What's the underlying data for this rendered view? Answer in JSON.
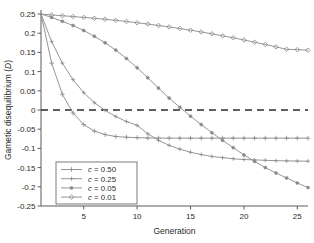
{
  "chart_data": {
    "type": "line",
    "title": "",
    "xlabel": "Generation",
    "ylabel": "Gametic disequilibrium (D)",
    "xlim": [
      1,
      26
    ],
    "ylim": [
      -0.25,
      0.25
    ],
    "xticks": [
      5,
      10,
      15,
      20,
      25
    ],
    "yticks": [
      0.25,
      0.2,
      0.15,
      0.1,
      0.05,
      0,
      -0.05,
      -0.1,
      -0.15,
      -0.2,
      -0.25
    ],
    "ytick_labels": [
      "0.25",
      "0.2",
      "0.15",
      "0.1",
      "0.05",
      "0",
      "-0.05",
      "-0.1",
      "-0.15",
      "-0.2",
      "-0.25"
    ],
    "xtick_labels": [
      "5",
      "10",
      "15",
      "20",
      "25"
    ],
    "grid": false,
    "legend_position": "lower-left",
    "zero_reference_line": {
      "value": 0,
      "style": "dashed",
      "color": "#2b2b2b"
    },
    "line_color": "#8a8a8a",
    "x": [
      1,
      2,
      3,
      4,
      5,
      6,
      7,
      8,
      9,
      10,
      11,
      12,
      13,
      14,
      15,
      16,
      17,
      18,
      19,
      20,
      21,
      22,
      23,
      24,
      25,
      26
    ],
    "series": [
      {
        "name": "c = 0.50",
        "c_value": 0.5,
        "marker": "plus",
        "values": [
          0.25,
          0.122,
          0.041,
          -0.008,
          -0.038,
          -0.055,
          -0.064,
          -0.069,
          -0.071,
          -0.072,
          -0.0728,
          -0.0731,
          -0.0732,
          -0.0733,
          -0.0733,
          -0.0733,
          -0.0733,
          -0.0733,
          -0.0733,
          -0.0733,
          -0.0733,
          -0.0733,
          -0.0733,
          -0.0733,
          -0.0733,
          -0.0733
        ]
      },
      {
        "name": "c = 0.25",
        "c_value": 0.25,
        "marker": "plus-small",
        "values": [
          0.25,
          0.178,
          0.122,
          0.079,
          0.045,
          0.019,
          -0.001,
          -0.017,
          -0.03,
          -0.04,
          -0.062,
          -0.079,
          -0.092,
          -0.102,
          -0.11,
          -0.116,
          -0.121,
          -0.124,
          -0.127,
          -0.129,
          -0.13,
          -0.131,
          -0.132,
          -0.1325,
          -0.133,
          -0.1333
        ]
      },
      {
        "name": "c = 0.05",
        "c_value": 0.05,
        "marker": "dot",
        "values": [
          0.25,
          0.241,
          0.231,
          0.22,
          0.207,
          0.192,
          0.175,
          0.156,
          0.134,
          0.11,
          0.084,
          0.057,
          0.031,
          0.007,
          -0.016,
          -0.038,
          -0.059,
          -0.079,
          -0.098,
          -0.117,
          -0.134,
          -0.15,
          -0.164,
          -0.177,
          -0.19,
          -0.202
        ]
      },
      {
        "name": "c = 0.01",
        "c_value": 0.01,
        "marker": "diamond",
        "values": [
          0.25,
          0.2475,
          0.2455,
          0.2435,
          0.2412,
          0.2388,
          0.2362,
          0.2335,
          0.2305,
          0.2272,
          0.2238,
          0.2202,
          0.2163,
          0.2122,
          0.2078,
          0.2032,
          0.1984,
          0.1933,
          0.188,
          0.1824,
          0.1766,
          0.1706,
          0.1644,
          0.158,
          0.1572,
          0.1556
        ]
      }
    ]
  },
  "legend": {
    "entries": [
      {
        "var": "c",
        "eq": " = 0.50"
      },
      {
        "var": "c",
        "eq": " = 0.25"
      },
      {
        "var": "c",
        "eq": " = 0.05"
      },
      {
        "var": "c",
        "eq": " = 0.01"
      }
    ]
  },
  "ylabel_parts": {
    "main": "Gametic disequilibrium (",
    "italic": "D",
    "tail": ")"
  }
}
